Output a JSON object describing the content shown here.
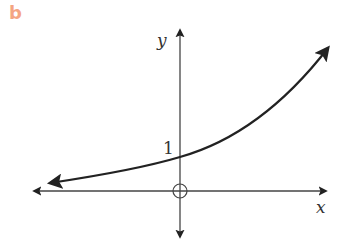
{
  "panel_label": "b",
  "axes": {
    "x_label": "x",
    "y_label": "y",
    "origin_marker": "open-circle"
  },
  "annotations": {
    "y_intercept_label": "1"
  },
  "curve": {
    "description": "exponential growth curve passing through (0,1), approaching x-axis on the left",
    "color": "#222222"
  },
  "colors": {
    "panel_label": "#f4a582",
    "axes": "#333333",
    "curve": "#222222"
  }
}
